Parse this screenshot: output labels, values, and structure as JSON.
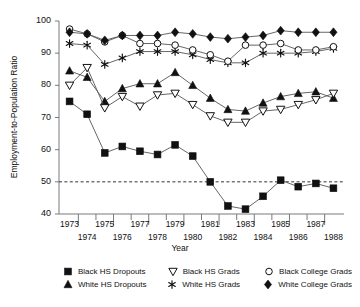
{
  "chart_data": {
    "type": "line",
    "title": "",
    "xlabel": "Year",
    "ylabel": "Employment-to-Population Ratio",
    "x": [
      1973,
      1974,
      1975,
      1976,
      1977,
      1978,
      1979,
      1980,
      1981,
      1982,
      1983,
      1984,
      1985,
      1986,
      1987,
      1988
    ],
    "xlim": [
      1972.4,
      1988.6
    ],
    "ylim": [
      40,
      100
    ],
    "yticks": [
      40,
      50,
      60,
      70,
      80,
      90,
      100
    ],
    "xticks": [
      1973,
      1974,
      1975,
      1976,
      1977,
      1978,
      1979,
      1980,
      1981,
      1982,
      1983,
      1984,
      1985,
      1986,
      1987,
      1988
    ],
    "grid": false,
    "reference_line": {
      "y": 50,
      "style": "dashed"
    },
    "legend_position": "bottom",
    "series": [
      {
        "name": "Black HS Dropouts",
        "marker": "filled-square",
        "values": [
          75.0,
          71.0,
          59.0,
          61.0,
          59.5,
          58.5,
          61.5,
          58.0,
          50.0,
          42.5,
          41.5,
          45.5,
          50.5,
          48.5,
          49.5,
          48.0
        ]
      },
      {
        "name": "White HS Dropouts",
        "marker": "filled-triangle-up",
        "values": [
          84.5,
          82.5,
          75.0,
          79.0,
          80.5,
          80.5,
          84.0,
          80.0,
          76.0,
          72.5,
          72.0,
          74.5,
          76.5,
          77.5,
          78.0,
          76.0
        ]
      },
      {
        "name": "Black HS Grads",
        "marker": "open-triangle-down",
        "values": [
          80.0,
          85.5,
          73.0,
          76.5,
          73.5,
          77.0,
          77.5,
          74.0,
          70.5,
          68.5,
          68.5,
          72.0,
          72.5,
          74.0,
          75.5,
          77.5
        ]
      },
      {
        "name": "White HS Grads",
        "marker": "asterisk",
        "values": [
          93.0,
          92.5,
          86.5,
          88.5,
          90.5,
          90.5,
          90.5,
          89.5,
          88.0,
          87.0,
          87.0,
          90.0,
          90.0,
          90.0,
          90.5,
          91.5
        ]
      },
      {
        "name": "Black College Grads",
        "marker": "open-circle",
        "values": [
          97.5,
          96.0,
          93.5,
          95.5,
          93.0,
          93.0,
          92.5,
          91.0,
          89.5,
          87.5,
          92.5,
          92.5,
          93.0,
          91.0,
          91.0,
          92.0
        ]
      },
      {
        "name": "White College Grads",
        "marker": "filled-diamond",
        "values": [
          96.5,
          96.0,
          94.0,
          95.5,
          95.5,
          95.5,
          96.5,
          96.0,
          95.0,
          94.5,
          95.0,
          95.5,
          97.0,
          96.5,
          96.5,
          96.5
        ]
      }
    ]
  },
  "axis": {
    "ylabel": "Employment-to-Population Ratio",
    "xlabel": "Year",
    "yticks": [
      "100",
      "90",
      "80",
      "70",
      "60",
      "50",
      "40"
    ],
    "xticks_top": [
      "1973",
      "1975",
      "1977",
      "1979",
      "1981",
      "1983",
      "1985",
      "1987"
    ],
    "xticks_bottom": [
      "1974",
      "1976",
      "1978",
      "1980",
      "1982",
      "1984",
      "1986",
      "1988"
    ]
  },
  "legend": {
    "rows": [
      [
        {
          "marker": "filled-square",
          "label": "Black HS Dropouts"
        },
        {
          "marker": "open-triangle-down",
          "label": "Black HS Grads"
        },
        {
          "marker": "open-circle",
          "label": "Black College Grads"
        }
      ],
      [
        {
          "marker": "filled-triangle-up",
          "label": "White HS Dropouts"
        },
        {
          "marker": "asterisk",
          "label": "White HS Grads"
        },
        {
          "marker": "filled-diamond",
          "label": "White College Grads"
        }
      ]
    ]
  },
  "colors": {
    "ink": "#111111",
    "line": "#555555",
    "background": "#ffffff"
  }
}
